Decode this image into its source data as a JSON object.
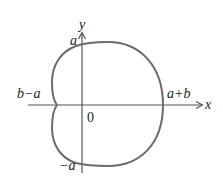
{
  "figure": {
    "type": "limacon (dimpled)",
    "curve_color": "#6b6b6b",
    "axis_color": "#555555",
    "labels": {
      "y_axis": "y",
      "x_axis": "x",
      "top_intercept": "a",
      "bottom_intercept": "−a",
      "left_intercept": "b−a",
      "right_intercept": "a+b",
      "origin": "0"
    }
  }
}
